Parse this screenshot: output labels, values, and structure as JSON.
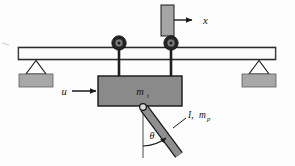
{
  "figure": {
    "background_color": "#fdfdfd"
  },
  "colors": {
    "stroke": "#1a1a1a",
    "cart_fill": "#8a8a8a",
    "beam_fill": "#fbfbfb",
    "support_fill": "#a8a8a8",
    "wall_fill": "#a5a5a5",
    "wheel_outer": "#262626",
    "wheel_hub": "#6e6e6e",
    "rod_fill": "#8f8f8f",
    "text": "#141414"
  },
  "labels": {
    "displacement": {
      "symbol": "x",
      "role": "global-x-axis-direction"
    },
    "input_force": {
      "symbol": "u",
      "role": "control-input-force-on-cart"
    },
    "cart_mass": {
      "base": "m",
      "sub": "t",
      "role": "cart-trolley-mass"
    },
    "pendulum": {
      "inertia": "I,",
      "base": "m",
      "sub": "p",
      "role": "pendulum-inertia-and-mass"
    },
    "angle": {
      "symbol": "θ",
      "role": "pendulum-angle-from-vertical"
    }
  },
  "components": {
    "beam": {
      "name": "horizontal rail beam",
      "x": 18,
      "y": 47,
      "width": 258,
      "height": 13
    },
    "left_support": {
      "name": "pin support left",
      "apex_x": 36,
      "apex_y": 61,
      "base_y": 74
    },
    "right_support": {
      "name": "pin support right",
      "apex_x": 259,
      "apex_y": 61,
      "base_y": 74
    },
    "wheels": [
      {
        "name": "wheel-left",
        "cx": 119,
        "cy": 43,
        "r": 7
      },
      {
        "name": "wheel-right",
        "cx": 171,
        "cy": 43,
        "r": 7
      }
    ],
    "cart": {
      "name": "cart body",
      "x": 98,
      "y": 76,
      "width": 84,
      "height": 30
    },
    "rod": {
      "name": "pendulum rod",
      "pivot_x": 143,
      "pivot_y": 107,
      "tip_x": 177,
      "tip_y": 153,
      "thickness": 8
    },
    "wall": {
      "name": "reference wall block",
      "x": 161,
      "y": 5,
      "width": 13,
      "height": 31
    },
    "vertical_ref": {
      "name": "vertical dashed reference",
      "x": 143,
      "y1": 110,
      "y2": 158
    }
  },
  "arrows": {
    "x_arrow": {
      "from_x": 174,
      "to_x": 199,
      "y": 20
    },
    "u_arrow": {
      "from_x": 68,
      "to_x": 97,
      "y": 91
    },
    "theta_arc": {
      "cx": 143,
      "cy": 107,
      "r": 38
    }
  }
}
